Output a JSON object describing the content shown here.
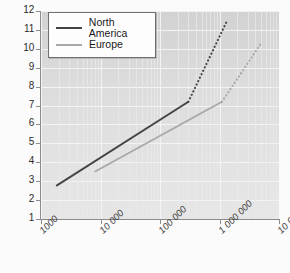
{
  "chart_data": {
    "type": "line",
    "title": "",
    "xlabel": "",
    "ylabel": "Urban heat difference (°C)",
    "xscale": "log",
    "yscale": "linear",
    "xlim": [
      1000,
      10000000
    ],
    "ylim": [
      1,
      12
    ],
    "grid": true,
    "legend_position": "top-left",
    "xticklabels": [
      "1000",
      "10 000",
      "100 000",
      "1 000 000",
      "10 000 000"
    ],
    "xtickvalues": [
      1000,
      10000,
      100000,
      1000000,
      10000000
    ],
    "yticklabels": [
      "1",
      "2",
      "3",
      "4",
      "5",
      "6",
      "7",
      "8",
      "9",
      "10",
      "11",
      "12"
    ],
    "ytickvalues": [
      1,
      2,
      3,
      4,
      5,
      6,
      7,
      8,
      9,
      10,
      11,
      12
    ],
    "series": [
      {
        "name": "North America",
        "color": "#444444",
        "solid_points": [
          [
            1800,
            2.75
          ],
          [
            300000,
            7.2
          ]
        ],
        "dotted_points": [
          [
            300000,
            7.2
          ],
          [
            1300000,
            11.4
          ]
        ],
        "values": [
          {
            "x": 1800,
            "y": 2.75,
            "style": "solid"
          },
          {
            "x": 300000,
            "y": 7.2,
            "style": "solid"
          },
          {
            "x": 1300000,
            "y": 11.4,
            "style": "dotted"
          }
        ]
      },
      {
        "name": "Europe",
        "color": "#a8a8a8",
        "solid_points": [
          [
            8000,
            3.5
          ],
          [
            1100000,
            7.2
          ]
        ],
        "dotted_points": [
          [
            1100000,
            7.2
          ],
          [
            5000000,
            10.3
          ]
        ],
        "values": [
          {
            "x": 8000,
            "y": 3.5,
            "style": "solid"
          },
          {
            "x": 1100000,
            "y": 7.2,
            "style": "solid"
          },
          {
            "x": 5000000,
            "y": 10.3,
            "style": "dotted"
          }
        ]
      }
    ]
  },
  "legend": {
    "entries": [
      {
        "label": "North America",
        "color": "#444444"
      },
      {
        "label": "Europe",
        "color": "#a8a8a8"
      }
    ]
  },
  "colors": {
    "north_america": "#444444",
    "europe": "#a8a8a8",
    "plot_background": "#dcdcdc",
    "gridline": "#f4f4f4",
    "axis": "#8c8c8c",
    "page_background": "#fbfbfb"
  }
}
